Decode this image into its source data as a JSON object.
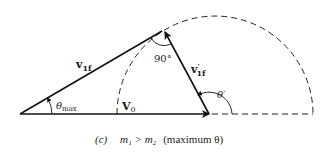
{
  "figure": {
    "panel": "(c)",
    "caption_condition": "m₁ > m₂",
    "caption_note": "(maximum θ)"
  },
  "labels": {
    "v1f": {
      "main": "v",
      "sub": "1f"
    },
    "v1f_prime": {
      "main": "v",
      "prime": "′",
      "sub": "1f"
    },
    "v0": {
      "main": "V",
      "sub": "0"
    },
    "theta_max": {
      "main": "θ",
      "sub": "max"
    },
    "theta_prime": "θ′",
    "right_angle": "90°"
  },
  "geometry": {
    "origin": [
      20,
      114
    ],
    "v0_tip": [
      209,
      114
    ],
    "apex": [
      164,
      30
    ],
    "circle_center": [
      215,
      114
    ],
    "circle_radius": 98
  }
}
